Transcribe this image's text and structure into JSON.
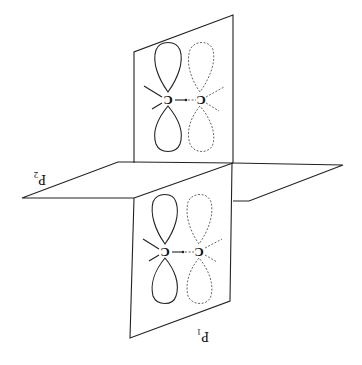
{
  "figure": {
    "orientation": "rotated-180",
    "planes": [
      {
        "label": "P",
        "subscript": "1"
      },
      {
        "label": "P",
        "subscript": "2"
      }
    ],
    "atoms": {
      "symbol": "C"
    },
    "orbital_styles": {
      "left_atom": "solid",
      "right_atom": "dashed"
    }
  }
}
